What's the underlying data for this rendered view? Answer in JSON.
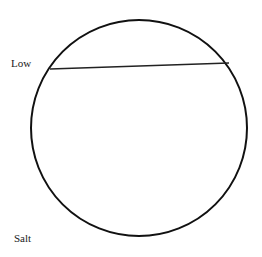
{
  "diagram": {
    "labels": {
      "top_left": "Low",
      "bottom_left": "Salt"
    },
    "shapes": {
      "circle": {
        "cx": 139,
        "cy": 128,
        "r": 108,
        "stroke": "#111111",
        "stroke_width": 2
      },
      "chord": {
        "x1": 50,
        "y1": 69,
        "x2": 229,
        "y2": 63,
        "stroke": "#222222",
        "stroke_width": 1.6
      }
    },
    "colors": {
      "background": "#ffffff",
      "stroke": "#111111",
      "text": "#1a1a1a"
    }
  }
}
